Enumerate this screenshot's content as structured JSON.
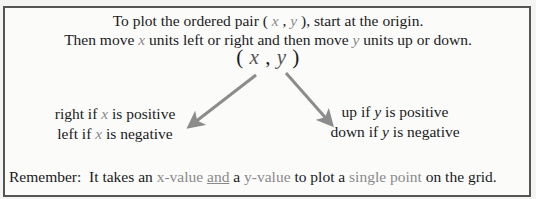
{
  "header": {
    "line1": {
      "before": "To plot the ordered pair ( ",
      "x": "x",
      "sep": " , ",
      "y": "y",
      "after": " ), start at the origin."
    },
    "line2": {
      "before": "Then move ",
      "x": "x",
      "middle": " units left or right and then move ",
      "y": "y",
      "after": " units up or down."
    }
  },
  "pair": {
    "open": "( ",
    "x": "x",
    "comma": " , ",
    "y": "y",
    "close": " )"
  },
  "left_branch": {
    "line1": {
      "before": "right if ",
      "var": "x",
      "after": " is positive"
    },
    "line2": {
      "before": "left if ",
      "var": "x",
      "after": " is negative"
    }
  },
  "right_branch": {
    "line1": {
      "before": "up if ",
      "var": "y",
      "after": " is positive"
    },
    "line2": {
      "before": "down if ",
      "var": "y",
      "after": " is negative"
    }
  },
  "remember": {
    "label": "Remember:",
    "t1": "  It takes an ",
    "xval": "x-value",
    "sp1": " ",
    "and": "and",
    "t2": " a ",
    "yval": "y-value",
    "t3": " to plot a ",
    "single_point": "single point",
    "t4": " on the grid."
  },
  "colors": {
    "border": "#555555",
    "arrow": "#8c8c8c",
    "highlight_text": "#8a8a8a",
    "text": "#1a1a1a"
  }
}
